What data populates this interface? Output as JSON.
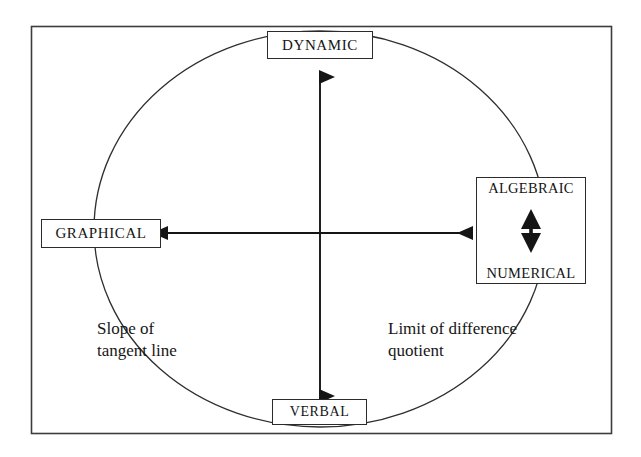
{
  "diagram": {
    "frame": {
      "name": "outer-frame",
      "x": 31,
      "y": 26,
      "width": 581,
      "height": 408,
      "stroke": "#3a3a3a"
    },
    "ellipse": {
      "name": "connecting-ellipse",
      "cx": 320,
      "cy": 229,
      "rx": 226,
      "ry": 198,
      "stroke": "#2f2f2f"
    },
    "nodes": [
      {
        "id": "dynamic",
        "label": "DYNAMIC",
        "position": "top"
      },
      {
        "id": "graphical",
        "label": "GRAPHICAL",
        "position": "left"
      },
      {
        "id": "algebraic",
        "label": "ALGEBRAIC",
        "position": "right-top"
      },
      {
        "id": "numerical",
        "label": "NUMERICAL",
        "position": "right-bottom"
      },
      {
        "id": "verbal",
        "label": "VERBAL",
        "position": "bottom"
      }
    ],
    "arrows": [
      {
        "id": "vertical-axis",
        "kind": "double-headed",
        "orientation": "vertical",
        "from": "DYNAMIC",
        "to": "VERBAL",
        "x": 320,
        "y1": 75,
        "y2": 398
      },
      {
        "id": "horizontal-axis",
        "kind": "double-headed",
        "orientation": "horizontal",
        "from": "GRAPHICAL",
        "to": "ALGEBRAIC/NUMERICAL",
        "y": 233,
        "x1": 165,
        "x2": 474
      },
      {
        "id": "algebraic-numerical-link",
        "kind": "double-headed",
        "orientation": "vertical",
        "from": "ALGEBRAIC",
        "to": "NUMERICAL",
        "x": 531,
        "y1": 208,
        "y2": 258
      }
    ],
    "annotations": [
      {
        "id": "left-annotation",
        "text": "Slope of\ntangent line",
        "near": "GRAPHICAL"
      },
      {
        "id": "right-annotation",
        "text": "Limit of difference\nquotient",
        "near": "ALGEBRAIC/NUMERICAL"
      }
    ],
    "colors": {
      "ink": "#1a1a1a",
      "line": "#2f2f2f",
      "background": "#ffffff"
    }
  }
}
